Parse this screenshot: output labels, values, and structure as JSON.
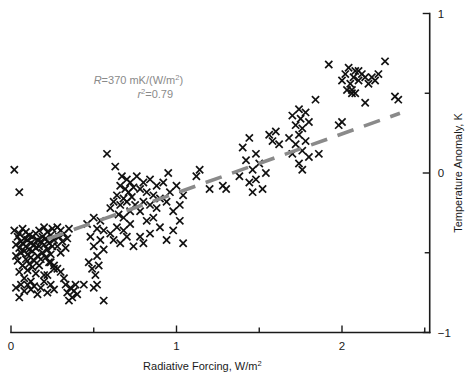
{
  "figure": {
    "width": 471,
    "height": 381,
    "background": "#ffffff"
  },
  "chart_data": {
    "type": "scatter",
    "title": "",
    "xlabel": "Radiative Forcing, W/m²",
    "ylabel": "Temperature Anomaly, K",
    "xlim": [
      0,
      2.53
    ],
    "ylim": [
      -1,
      1
    ],
    "xticks": [
      0,
      1,
      2
    ],
    "xticklabels": [
      "0",
      "1",
      "2"
    ],
    "xminorticks": [
      0.5,
      1.5,
      2.5
    ],
    "yticks": [
      -1,
      0,
      1
    ],
    "yticklabels": [
      "−1",
      "0",
      "1"
    ],
    "yminorticks": [
      -0.5,
      0.5
    ],
    "yaxis_position": "right",
    "grid": false,
    "legend": null,
    "marker": "x",
    "marker_color": "#111111",
    "annotations": [
      {
        "name": "regression-annotation",
        "line1": "R = 370 mK/(W/m²)",
        "line1_parts": {
          "symbol": "R",
          "equals": "=",
          "value": "370",
          "units": "mK/(W/m",
          "exponent": "2",
          "close": ")"
        },
        "line2": "r² = 0.79",
        "line2_parts": {
          "symbol": "r",
          "exponent": "2",
          "equals": "=",
          "value": "0.79"
        },
        "color": "#8a8a8a",
        "x": 1.04,
        "y": 0.56
      }
    ],
    "trendline": {
      "name": "regression-line",
      "style": "dashed",
      "color": "#8a8a8a",
      "slope": 0.37,
      "intercept": -0.495,
      "x_start": 0.22,
      "x_end": 2.35
    },
    "points": [
      [
        0.02,
        -0.36
      ],
      [
        0.03,
        -0.45
      ],
      [
        0.03,
        -0.52
      ],
      [
        0.04,
        -0.4
      ],
      [
        0.04,
        -0.55
      ],
      [
        0.05,
        -0.38
      ],
      [
        0.05,
        -0.47
      ],
      [
        0.05,
        -0.62
      ],
      [
        0.06,
        -0.43
      ],
      [
        0.06,
        -0.5
      ],
      [
        0.07,
        -0.35
      ],
      [
        0.07,
        -0.44
      ],
      [
        0.07,
        -0.58
      ],
      [
        0.08,
        -0.41
      ],
      [
        0.08,
        -0.49
      ],
      [
        0.08,
        -0.66
      ],
      [
        0.09,
        -0.37
      ],
      [
        0.09,
        -0.46
      ],
      [
        0.09,
        -0.54
      ],
      [
        0.1,
        -0.42
      ],
      [
        0.1,
        -0.51
      ],
      [
        0.1,
        -0.61
      ],
      [
        0.11,
        -0.39
      ],
      [
        0.11,
        -0.48
      ],
      [
        0.11,
        -0.57
      ],
      [
        0.12,
        -0.44
      ],
      [
        0.12,
        -0.53
      ],
      [
        0.12,
        -0.68
      ],
      [
        0.13,
        -0.4
      ],
      [
        0.13,
        -0.49
      ],
      [
        0.13,
        -0.59
      ],
      [
        0.14,
        -0.45
      ],
      [
        0.14,
        -0.55
      ],
      [
        0.15,
        -0.38
      ],
      [
        0.15,
        -0.47
      ],
      [
        0.15,
        -0.63
      ],
      [
        0.16,
        -0.42
      ],
      [
        0.16,
        -0.52
      ],
      [
        0.17,
        -0.36
      ],
      [
        0.17,
        -0.46
      ],
      [
        0.17,
        -0.58
      ],
      [
        0.18,
        -0.43
      ],
      [
        0.18,
        -0.54
      ],
      [
        0.19,
        -0.4
      ],
      [
        0.19,
        -0.5
      ],
      [
        0.2,
        -0.34
      ],
      [
        0.2,
        -0.45
      ],
      [
        0.2,
        -0.64
      ],
      [
        0.21,
        -0.41
      ],
      [
        0.21,
        -0.53
      ],
      [
        0.22,
        -0.37
      ],
      [
        0.22,
        -0.48
      ],
      [
        0.23,
        -0.44
      ],
      [
        0.23,
        -0.56
      ],
      [
        0.24,
        -0.39
      ],
      [
        0.24,
        -0.51
      ],
      [
        0.25,
        -0.35
      ],
      [
        0.25,
        -0.46
      ],
      [
        0.26,
        -0.42
      ],
      [
        0.26,
        -0.6
      ],
      [
        0.02,
        0.02
      ],
      [
        0.05,
        -0.12
      ],
      [
        0.03,
        -0.72
      ],
      [
        0.05,
        -0.78
      ],
      [
        0.06,
        -0.7
      ],
      [
        0.08,
        -0.74
      ],
      [
        0.1,
        -0.7
      ],
      [
        0.12,
        -0.73
      ],
      [
        0.14,
        -0.71
      ],
      [
        0.16,
        -0.76
      ],
      [
        0.18,
        -0.72
      ],
      [
        0.2,
        -0.68
      ],
      [
        0.22,
        -0.75
      ],
      [
        0.24,
        -0.7
      ],
      [
        0.26,
        -0.73
      ],
      [
        0.28,
        -0.34
      ],
      [
        0.28,
        -0.46
      ],
      [
        0.29,
        -0.4
      ],
      [
        0.3,
        -0.36
      ],
      [
        0.3,
        -0.5
      ],
      [
        0.31,
        -0.43
      ],
      [
        0.32,
        -0.38
      ],
      [
        0.33,
        -0.47
      ],
      [
        0.34,
        -0.41
      ],
      [
        0.35,
        -0.35
      ],
      [
        0.3,
        -0.62
      ],
      [
        0.32,
        -0.66
      ],
      [
        0.33,
        -0.7
      ],
      [
        0.34,
        -0.75
      ],
      [
        0.35,
        -0.8
      ],
      [
        0.36,
        -0.72
      ],
      [
        0.37,
        -0.78
      ],
      [
        0.38,
        -0.74
      ],
      [
        0.39,
        -0.7
      ],
      [
        0.4,
        -0.76
      ],
      [
        0.24,
        -0.56
      ],
      [
        0.26,
        -0.58
      ],
      [
        0.28,
        -0.6
      ],
      [
        0.22,
        -0.64
      ],
      [
        0.46,
        -0.32
      ],
      [
        0.48,
        -0.4
      ],
      [
        0.5,
        -0.28
      ],
      [
        0.5,
        -0.46
      ],
      [
        0.52,
        -0.35
      ],
      [
        0.52,
        -0.52
      ],
      [
        0.54,
        -0.3
      ],
      [
        0.54,
        -0.42
      ],
      [
        0.56,
        -0.36
      ],
      [
        0.56,
        -0.48
      ],
      [
        0.47,
        -0.56
      ],
      [
        0.49,
        -0.6
      ],
      [
        0.51,
        -0.64
      ],
      [
        0.53,
        -0.58
      ],
      [
        0.5,
        -0.72
      ],
      [
        0.52,
        -0.7
      ],
      [
        0.58,
        0.12
      ],
      [
        0.6,
        -0.22
      ],
      [
        0.62,
        -0.18
      ],
      [
        0.63,
        0.04
      ],
      [
        0.64,
        -0.14
      ],
      [
        0.65,
        -0.26
      ],
      [
        0.66,
        -0.08
      ],
      [
        0.66,
        -0.2
      ],
      [
        0.67,
        -0.02
      ],
      [
        0.68,
        -0.16
      ],
      [
        0.68,
        -0.28
      ],
      [
        0.69,
        -0.1
      ],
      [
        0.7,
        -0.04
      ],
      [
        0.7,
        -0.18
      ],
      [
        0.71,
        -0.12
      ],
      [
        0.72,
        -0.06
      ],
      [
        0.72,
        -0.24
      ],
      [
        0.73,
        -0.15
      ],
      [
        0.74,
        -0.09
      ],
      [
        0.75,
        -0.2
      ],
      [
        0.6,
        -0.38
      ],
      [
        0.62,
        -0.42
      ],
      [
        0.64,
        -0.34
      ],
      [
        0.66,
        -0.44
      ],
      [
        0.68,
        -0.36
      ],
      [
        0.7,
        -0.4
      ],
      [
        0.72,
        -0.32
      ],
      [
        0.74,
        -0.46
      ],
      [
        0.76,
        -0.02
      ],
      [
        0.78,
        -0.1
      ],
      [
        0.78,
        -0.24
      ],
      [
        0.8,
        -0.06
      ],
      [
        0.8,
        -0.18
      ],
      [
        0.82,
        -0.12
      ],
      [
        0.82,
        -0.3
      ],
      [
        0.84,
        -0.04
      ],
      [
        0.84,
        -0.2
      ],
      [
        0.86,
        -0.14
      ],
      [
        0.86,
        -0.28
      ],
      [
        0.88,
        -0.08
      ],
      [
        0.88,
        -0.22
      ],
      [
        0.9,
        -0.16
      ],
      [
        0.78,
        -0.4
      ],
      [
        0.8,
        -0.44
      ],
      [
        0.84,
        -0.38
      ],
      [
        0.92,
        -0.06
      ],
      [
        0.94,
        -0.18
      ],
      [
        0.95,
        0.0
      ],
      [
        0.96,
        -0.12
      ],
      [
        0.98,
        -0.24
      ],
      [
        1.0,
        -0.08
      ],
      [
        1.02,
        -0.2
      ],
      [
        1.04,
        -0.14
      ],
      [
        0.9,
        -0.34
      ],
      [
        0.94,
        -0.42
      ],
      [
        0.98,
        -0.36
      ],
      [
        1.02,
        -0.3
      ],
      [
        1.04,
        -0.44
      ],
      [
        1.12,
        -0.02
      ],
      [
        1.14,
        0.02
      ],
      [
        1.2,
        -0.1
      ],
      [
        1.28,
        -0.08
      ],
      [
        1.3,
        -0.1
      ],
      [
        1.38,
        -0.02
      ],
      [
        1.4,
        0.16
      ],
      [
        1.42,
        0.08
      ],
      [
        1.44,
        -0.06
      ],
      [
        1.44,
        0.22
      ],
      [
        1.46,
        0.02
      ],
      [
        1.46,
        -0.12
      ],
      [
        1.48,
        0.12
      ],
      [
        1.48,
        -0.04
      ],
      [
        1.5,
        0.06
      ],
      [
        1.52,
        -0.1
      ],
      [
        1.54,
        0.0
      ],
      [
        1.56,
        0.24
      ],
      [
        1.58,
        0.2
      ],
      [
        1.6,
        0.26
      ],
      [
        1.62,
        0.18
      ],
      [
        1.68,
        0.22
      ],
      [
        1.7,
        0.36
      ],
      [
        1.7,
        0.12
      ],
      [
        1.72,
        0.3
      ],
      [
        1.72,
        0.18
      ],
      [
        1.74,
        0.4
      ],
      [
        1.74,
        0.24
      ],
      [
        1.75,
        0.34
      ],
      [
        1.76,
        0.14
      ],
      [
        1.76,
        0.28
      ],
      [
        1.78,
        0.38
      ],
      [
        1.78,
        0.2
      ],
      [
        1.8,
        0.32
      ],
      [
        1.8,
        0.1
      ],
      [
        1.74,
        0.06
      ],
      [
        1.76,
        0.02
      ],
      [
        1.84,
        0.46
      ],
      [
        1.86,
        0.12
      ],
      [
        1.92,
        0.68
      ],
      [
        1.98,
        0.3
      ],
      [
        2.0,
        0.32
      ],
      [
        2.0,
        0.58
      ],
      [
        2.02,
        0.62
      ],
      [
        2.03,
        0.52
      ],
      [
        2.04,
        0.66
      ],
      [
        2.05,
        0.56
      ],
      [
        2.06,
        0.5
      ],
      [
        2.07,
        0.6
      ],
      [
        2.08,
        0.64
      ],
      [
        2.1,
        0.58
      ],
      [
        2.12,
        0.62
      ],
      [
        2.14,
        0.6
      ],
      [
        2.16,
        0.56
      ],
      [
        2.18,
        0.6
      ],
      [
        2.06,
        0.52
      ],
      [
        2.08,
        0.5
      ],
      [
        2.14,
        0.44
      ],
      [
        2.2,
        0.58
      ],
      [
        2.26,
        0.7
      ],
      [
        2.32,
        0.48
      ],
      [
        2.34,
        0.46
      ],
      [
        2.22,
        0.62
      ],
      [
        2.1,
        0.64
      ],
      [
        0.44,
        -0.7
      ],
      [
        0.56,
        -0.8
      ]
    ]
  }
}
